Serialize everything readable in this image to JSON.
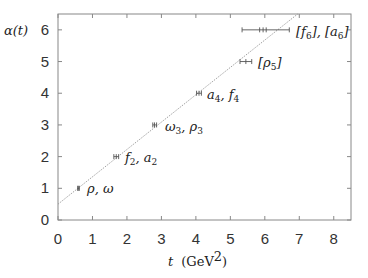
{
  "chart_data": {
    "type": "scatter",
    "title": "",
    "xlabel": "t (GeV²)",
    "ylabel": "α(t)",
    "xlim": [
      0,
      8.5
    ],
    "ylim": [
      0,
      6.5
    ],
    "xticks": [
      0,
      1,
      2,
      3,
      4,
      5,
      6,
      7,
      8
    ],
    "yticks": [
      0,
      1,
      2,
      3,
      4,
      5,
      6
    ],
    "grid": false,
    "legend": null,
    "series": [
      {
        "name": "resonances",
        "marker": "plus-with-xerror",
        "points": [
          {
            "label": "ρ, ω",
            "x": 0.59,
            "y": 1,
            "xerr": [
              0.57,
              0.62
            ]
          },
          {
            "label": "f₂, a₂",
            "x": 1.69,
            "y": 2,
            "xerr": [
              1.62,
              1.76
            ]
          },
          {
            "label": "ω₃, ρ₃",
            "x": 2.8,
            "y": 3,
            "xerr": [
              2.75,
              2.86
            ]
          },
          {
            "label": "a₄, f₄",
            "x": 4.09,
            "y": 4,
            "xerr": [
              4.02,
              4.16
            ]
          },
          {
            "label": "[ρ₅]",
            "x": 5.45,
            "y": 5,
            "xerr": [
              5.28,
              5.62
            ]
          },
          {
            "label": "[f₆], [a₆]",
            "x": 5.95,
            "y": 6,
            "xerr": [
              5.34,
              6.71
            ],
            "inner_ticks": [
              5.85,
              6.04
            ]
          }
        ]
      },
      {
        "name": "trajectory fit",
        "style": "dotted-line",
        "intercept": 0.5,
        "slope": 0.863
      }
    ]
  },
  "labels": {
    "y_axis": "α(t)",
    "x_axis_var": "t",
    "x_axis_unit": "(GeV",
    "x_axis_unit_sup": "2",
    "x_axis_unit_close": ")",
    "points": [
      {
        "main": "ρ, ω",
        "sub": ""
      },
      {
        "main": "f",
        "sub": "2",
        "main2": ", a",
        "sub2": "2"
      },
      {
        "main": "ω",
        "sub": "3",
        "main2": ", ρ",
        "sub2": "3"
      },
      {
        "main": "a",
        "sub": "4",
        "main2": ", f",
        "sub2": "4"
      },
      {
        "main": "[ρ",
        "sub": "5",
        "main2": "]",
        "sub2": ""
      },
      {
        "main": "[f",
        "sub": "6",
        "main2": "], [a",
        "sub2": "6",
        "main3": "]"
      }
    ],
    "x_ticks": [
      "0",
      "1",
      "2",
      "3",
      "4",
      "5",
      "6",
      "7",
      "8"
    ],
    "y_ticks": [
      "0",
      "1",
      "2",
      "3",
      "4",
      "5",
      "6"
    ]
  },
  "colors": {
    "axis": "#888888",
    "line": "#999999",
    "marker": "#555555",
    "text": "#333333"
  }
}
